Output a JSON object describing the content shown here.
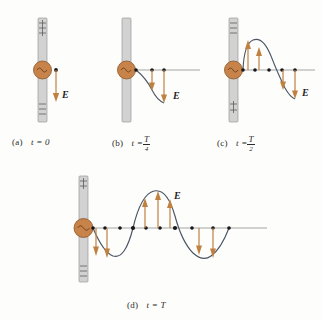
{
  "figure": {
    "background_color": "#fdfdfb",
    "field_label": "E",
    "colors": {
      "antenna_fill": "#d2d2d2",
      "antenna_edge": "#9a9a9a",
      "oscillator_fill": "#c8834a",
      "oscillator_edge": "#8a5426",
      "arrow": "#c08040",
      "curve": "#4a5564",
      "dot": "#17171c",
      "axis": "#8e8e8e",
      "text": "#2b2b2b"
    }
  },
  "panels": [
    {
      "id": "a",
      "tag": "(a)",
      "time_text": "t = 0",
      "time_kind": "plain",
      "time_value": "0",
      "antenna_top_charge": "+",
      "antenna_bottom_charge": "-",
      "field_label": "E",
      "description": "Charge separated; single downward field vector at the antenna; no wave yet",
      "wave": {
        "kind": "none",
        "cycles_visible": 0
      },
      "vectors": [
        {
          "x_frac": 0.0,
          "direction": "down",
          "magnitude": 1.0
        }
      ]
    },
    {
      "id": "b",
      "tag": "(b)",
      "time_text": "t = T/4",
      "time_kind": "fraction",
      "time_numerator": "T",
      "time_denominator": "4",
      "antenna_top_charge": "",
      "antenna_bottom_charge": "",
      "field_label": "E",
      "description": "Quarter period; descending quarter-wave, downward vectors increasing away from antenna",
      "wave": {
        "kind": "quarter",
        "cycles_visible": 0.25
      },
      "vectors": [
        {
          "x_frac": 0.28,
          "direction": "down",
          "magnitude": 0.45
        },
        {
          "x_frac": 0.52,
          "direction": "down",
          "magnitude": 0.9
        }
      ]
    },
    {
      "id": "c",
      "tag": "(c)",
      "time_text": "t = T/2",
      "time_kind": "fraction",
      "time_numerator": "T",
      "time_denominator": "2",
      "antenna_top_charge": "-",
      "antenna_bottom_charge": "+",
      "field_label": "E",
      "description": "Half period; half-wave with upward vectors near antenna and downward vectors farther out",
      "wave": {
        "kind": "half",
        "cycles_visible": 0.5
      },
      "vectors": [
        {
          "x_frac": 0.08,
          "direction": "up",
          "magnitude": 0.95
        },
        {
          "x_frac": 0.26,
          "direction": "up",
          "magnitude": 0.62
        },
        {
          "x_frac": 0.58,
          "direction": "down",
          "magnitude": 0.48
        },
        {
          "x_frac": 0.78,
          "direction": "down",
          "magnitude": 0.9
        }
      ]
    },
    {
      "id": "d",
      "tag": "(d)",
      "time_text": "t = T",
      "time_kind": "plain",
      "time_value": "T",
      "antenna_top_charge": "+",
      "antenna_bottom_charge": "-",
      "field_label": "E",
      "description": "Full period; one complete wavelength radiated, downward lobe then upward lobe then downward lobe",
      "wave": {
        "kind": "full",
        "cycles_visible": 1.0
      },
      "vectors": [
        {
          "x_frac": 0.06,
          "direction": "down",
          "magnitude": 0.72
        },
        {
          "x_frac": 0.15,
          "direction": "down",
          "magnitude": 0.95
        },
        {
          "x_frac": 0.33,
          "direction": "up",
          "magnitude": 0.62
        },
        {
          "x_frac": 0.42,
          "direction": "up",
          "magnitude": 0.95
        },
        {
          "x_frac": 0.51,
          "direction": "up",
          "magnitude": 0.72
        },
        {
          "x_frac": 0.72,
          "direction": "down",
          "magnitude": 0.62
        },
        {
          "x_frac": 0.81,
          "direction": "down",
          "magnitude": 0.92
        }
      ]
    }
  ]
}
